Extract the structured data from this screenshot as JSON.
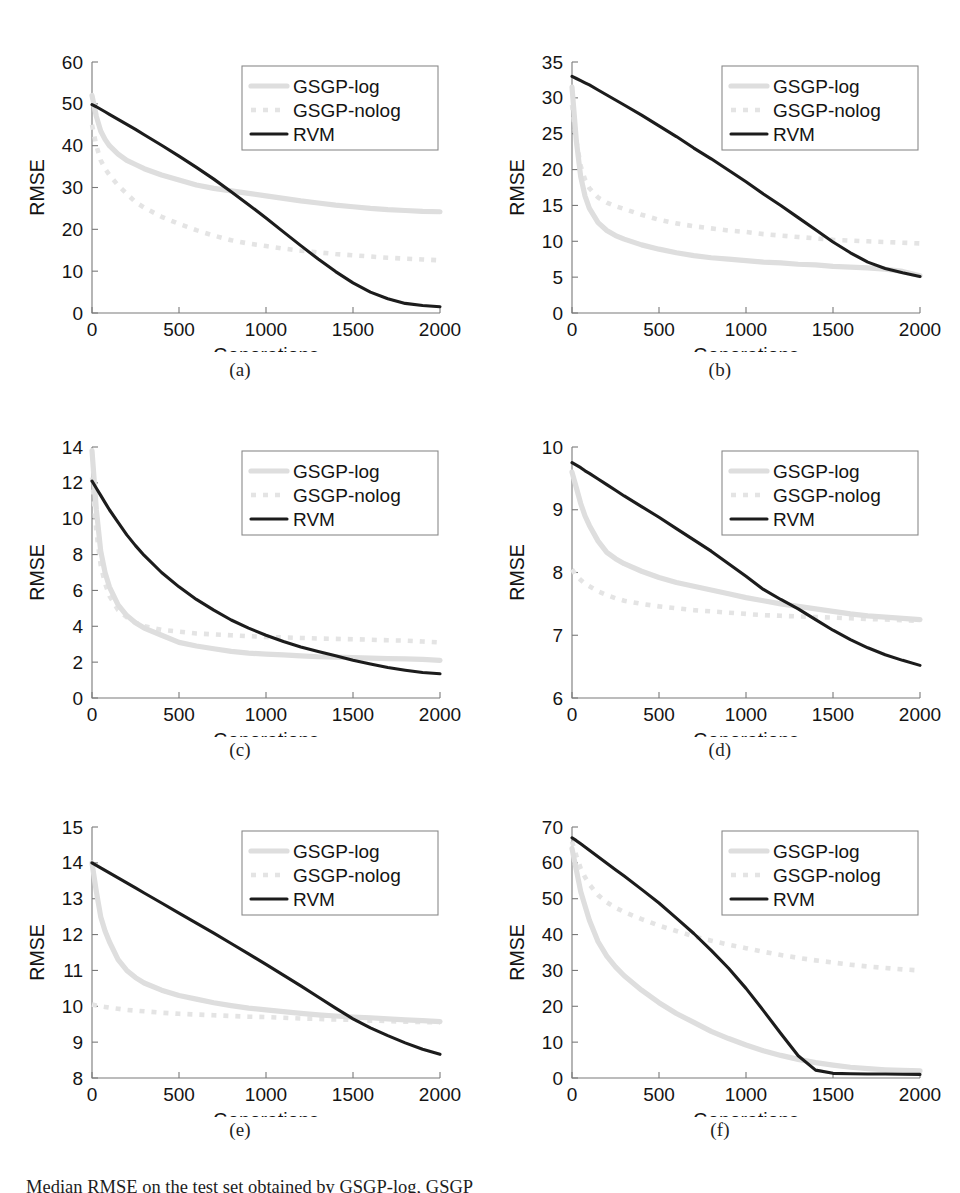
{
  "figure": {
    "caption": "Median RMSE on the test set obtained by GSGP-log, GSGP",
    "axis_titles": {
      "x": "Generations",
      "y": "RMSE"
    },
    "legend": {
      "entries": [
        {
          "label": "GSGP-log",
          "style": "thick-light-solid",
          "color": "#dedede"
        },
        {
          "label": "GSGP-nolog",
          "style": "light-dashed",
          "color": "#e4e4e4"
        },
        {
          "label": "RVM",
          "style": "black-solid",
          "color": "#1c1c1c"
        }
      ]
    }
  },
  "chart_data": [
    {
      "id": "a",
      "panel_label": "(a)",
      "type": "line",
      "title": "",
      "xlabel": "Generations",
      "ylabel": "RMSE",
      "xlim": [
        0,
        2000
      ],
      "ylim": [
        0,
        60
      ],
      "xticks": [
        0,
        500,
        1000,
        1500,
        2000
      ],
      "yticks": [
        0,
        10,
        20,
        30,
        40,
        50,
        60
      ],
      "grid": false,
      "legend_position": "top-right",
      "x": [
        0,
        25,
        50,
        75,
        100,
        150,
        200,
        250,
        300,
        400,
        500,
        600,
        700,
        800,
        900,
        1000,
        1100,
        1200,
        1300,
        1400,
        1500,
        1600,
        1700,
        1800,
        1900,
        2000
      ],
      "series": [
        {
          "name": "GSGP-log",
          "values": [
            52,
            47,
            43.5,
            41.5,
            40,
            38,
            36.5,
            35.5,
            34.5,
            33,
            31.8,
            30.6,
            29.8,
            29.2,
            28.6,
            28.0,
            27.4,
            26.8,
            26.3,
            25.8,
            25.4,
            25.0,
            24.7,
            24.5,
            24.3,
            24.2
          ]
        },
        {
          "name": "GSGP-nolog",
          "values": [
            45,
            40,
            36.5,
            34.5,
            33,
            30.5,
            28.5,
            26.5,
            25.2,
            23,
            21.3,
            19.8,
            18.5,
            17.4,
            16.6,
            16.0,
            15.4,
            14.9,
            14.5,
            14.1,
            13.8,
            13.5,
            13.2,
            13.0,
            12.8,
            12.6
          ]
        },
        {
          "name": "RVM",
          "values": [
            49.8,
            49.3,
            48.7,
            48.1,
            47.5,
            46.3,
            45.1,
            43.9,
            42.6,
            40.1,
            37.5,
            34.8,
            32.0,
            29.0,
            25.9,
            22.7,
            19.4,
            16.1,
            12.9,
            9.9,
            7.2,
            5.0,
            3.4,
            2.3,
            1.8,
            1.5
          ]
        }
      ]
    },
    {
      "id": "b",
      "panel_label": "(b)",
      "type": "line",
      "title": "",
      "xlabel": "Generations",
      "ylabel": "RMSE",
      "xlim": [
        0,
        2000
      ],
      "ylim": [
        0,
        35
      ],
      "xticks": [
        0,
        500,
        1000,
        1500,
        2000
      ],
      "yticks": [
        0,
        5,
        10,
        15,
        20,
        25,
        30,
        35
      ],
      "grid": false,
      "legend_position": "top-right",
      "x": [
        0,
        25,
        50,
        75,
        100,
        150,
        200,
        250,
        300,
        400,
        500,
        600,
        700,
        800,
        900,
        1000,
        1100,
        1200,
        1300,
        1400,
        1500,
        1600,
        1700,
        1800,
        1900,
        2000
      ],
      "series": [
        {
          "name": "GSGP-log",
          "values": [
            31.5,
            24,
            19,
            16.3,
            14.6,
            12.6,
            11.5,
            10.8,
            10.3,
            9.5,
            8.9,
            8.4,
            8.0,
            7.7,
            7.5,
            7.3,
            7.1,
            7.0,
            6.8,
            6.7,
            6.5,
            6.4,
            6.3,
            6.1,
            5.8,
            5.2
          ]
        },
        {
          "name": "GSGP-nolog",
          "values": [
            29,
            24,
            20.5,
            18.6,
            17.4,
            16.1,
            15.4,
            14.9,
            14.5,
            13.7,
            13.0,
            12.5,
            12.1,
            11.8,
            11.5,
            11.3,
            11.0,
            10.8,
            10.6,
            10.4,
            10.2,
            10.1,
            10.0,
            9.9,
            9.8,
            9.7
          ]
        },
        {
          "name": "RVM",
          "values": [
            33,
            32.7,
            32.4,
            32.1,
            31.8,
            31.1,
            30.4,
            29.7,
            29.0,
            27.6,
            26.1,
            24.6,
            23.0,
            21.5,
            19.9,
            18.3,
            16.6,
            15.0,
            13.3,
            11.6,
            9.9,
            8.4,
            7.1,
            6.2,
            5.6,
            5.1
          ]
        }
      ]
    },
    {
      "id": "c",
      "panel_label": "(c)",
      "type": "line",
      "title": "",
      "xlabel": "Generations",
      "ylabel": "RMSE",
      "xlim": [
        0,
        2000
      ],
      "ylim": [
        0,
        14
      ],
      "xticks": [
        0,
        500,
        1000,
        1500,
        2000
      ],
      "yticks": [
        0,
        2,
        4,
        6,
        8,
        10,
        12,
        14
      ],
      "grid": false,
      "legend_position": "top-right",
      "x": [
        0,
        25,
        50,
        75,
        100,
        150,
        200,
        250,
        300,
        400,
        500,
        600,
        700,
        800,
        900,
        1000,
        1100,
        1200,
        1300,
        1400,
        1500,
        1600,
        1700,
        1800,
        1900,
        2000
      ],
      "series": [
        {
          "name": "GSGP-log",
          "values": [
            13.8,
            10.5,
            8.2,
            7.0,
            6.2,
            5.2,
            4.6,
            4.2,
            3.9,
            3.5,
            3.1,
            2.9,
            2.75,
            2.6,
            2.5,
            2.45,
            2.4,
            2.35,
            2.3,
            2.28,
            2.25,
            2.22,
            2.2,
            2.18,
            2.15,
            2.1
          ]
        },
        {
          "name": "GSGP-nolog",
          "values": [
            12.3,
            9.3,
            7.4,
            6.4,
            5.7,
            4.9,
            4.5,
            4.2,
            4.0,
            3.8,
            3.7,
            3.6,
            3.55,
            3.5,
            3.45,
            3.4,
            3.38,
            3.35,
            3.32,
            3.3,
            3.28,
            3.25,
            3.22,
            3.2,
            3.15,
            3.1
          ]
        },
        {
          "name": "RVM",
          "values": [
            12.1,
            11.7,
            11.3,
            10.9,
            10.5,
            9.8,
            9.1,
            8.5,
            7.95,
            7.0,
            6.2,
            5.5,
            4.9,
            4.35,
            3.9,
            3.5,
            3.15,
            2.85,
            2.6,
            2.35,
            2.1,
            1.9,
            1.7,
            1.55,
            1.42,
            1.35
          ]
        }
      ]
    },
    {
      "id": "d",
      "panel_label": "(d)",
      "type": "line",
      "title": "",
      "xlabel": "Generations",
      "ylabel": "RMSE",
      "xlim": [
        0,
        2000
      ],
      "ylim": [
        6,
        10
      ],
      "xticks": [
        0,
        500,
        1000,
        1500,
        2000
      ],
      "yticks": [
        6,
        7,
        8,
        9,
        10
      ],
      "grid": false,
      "legend_position": "top-right",
      "x": [
        0,
        25,
        50,
        75,
        100,
        150,
        200,
        250,
        300,
        400,
        500,
        600,
        700,
        800,
        900,
        1000,
        1100,
        1200,
        1300,
        1400,
        1500,
        1600,
        1700,
        1800,
        1900,
        2000
      ],
      "series": [
        {
          "name": "GSGP-log",
          "values": [
            9.6,
            9.35,
            9.1,
            8.9,
            8.75,
            8.5,
            8.32,
            8.22,
            8.14,
            8.02,
            7.92,
            7.84,
            7.78,
            7.72,
            7.66,
            7.6,
            7.55,
            7.5,
            7.46,
            7.42,
            7.38,
            7.34,
            7.31,
            7.29,
            7.27,
            7.25
          ]
        },
        {
          "name": "GSGP-nolog",
          "values": [
            8.05,
            7.95,
            7.88,
            7.82,
            7.78,
            7.7,
            7.64,
            7.59,
            7.55,
            7.5,
            7.46,
            7.43,
            7.4,
            7.38,
            7.36,
            7.34,
            7.32,
            7.31,
            7.3,
            7.29,
            7.28,
            7.27,
            7.26,
            7.25,
            7.24,
            7.23
          ]
        },
        {
          "name": "RVM",
          "values": [
            9.75,
            9.71,
            9.67,
            9.62,
            9.58,
            9.49,
            9.4,
            9.31,
            9.22,
            9.05,
            8.88,
            8.7,
            8.52,
            8.34,
            8.14,
            7.94,
            7.73,
            7.57,
            7.42,
            7.25,
            7.08,
            6.93,
            6.8,
            6.69,
            6.6,
            6.52
          ]
        }
      ]
    },
    {
      "id": "e",
      "panel_label": "(e)",
      "type": "line",
      "title": "",
      "xlabel": "Generations",
      "ylabel": "RMSE",
      "xlim": [
        0,
        2000
      ],
      "ylim": [
        8,
        15
      ],
      "xticks": [
        0,
        500,
        1000,
        1500,
        2000
      ],
      "yticks": [
        8,
        9,
        10,
        11,
        12,
        13,
        14,
        15
      ],
      "grid": false,
      "legend_position": "top-right",
      "x": [
        0,
        25,
        50,
        75,
        100,
        150,
        200,
        250,
        300,
        400,
        500,
        600,
        700,
        800,
        900,
        1000,
        1100,
        1200,
        1300,
        1400,
        1500,
        1600,
        1700,
        1800,
        1900,
        2000
      ],
      "series": [
        {
          "name": "GSGP-log",
          "values": [
            14.0,
            13.2,
            12.5,
            12.1,
            11.8,
            11.3,
            11.0,
            10.8,
            10.65,
            10.45,
            10.3,
            10.2,
            10.1,
            10.02,
            9.95,
            9.9,
            9.85,
            9.8,
            9.76,
            9.73,
            9.7,
            9.68,
            9.65,
            9.62,
            9.6,
            9.57
          ]
        },
        {
          "name": "GSGP-nolog",
          "values": [
            10.05,
            10.02,
            10.0,
            9.98,
            9.96,
            9.93,
            9.9,
            9.88,
            9.86,
            9.82,
            9.79,
            9.77,
            9.75,
            9.73,
            9.71,
            9.7,
            9.68,
            9.66,
            9.65,
            9.63,
            9.62,
            9.6,
            9.59,
            9.57,
            9.56,
            9.55
          ]
        },
        {
          "name": "RVM",
          "values": [
            14.0,
            13.93,
            13.86,
            13.79,
            13.72,
            13.58,
            13.44,
            13.3,
            13.16,
            12.88,
            12.6,
            12.32,
            12.04,
            11.75,
            11.46,
            11.17,
            10.87,
            10.57,
            10.26,
            9.95,
            9.65,
            9.4,
            9.18,
            8.98,
            8.8,
            8.66
          ]
        }
      ]
    },
    {
      "id": "f",
      "panel_label": "(f)",
      "type": "line",
      "title": "",
      "xlabel": "Generations",
      "ylabel": "RMSE",
      "xlim": [
        0,
        2000
      ],
      "ylim": [
        0,
        70
      ],
      "xticks": [
        0,
        500,
        1000,
        1500,
        2000
      ],
      "yticks": [
        0,
        10,
        20,
        30,
        40,
        50,
        60,
        70
      ],
      "grid": false,
      "legend_position": "top-right",
      "x": [
        0,
        25,
        50,
        75,
        100,
        150,
        200,
        250,
        300,
        400,
        500,
        600,
        700,
        800,
        900,
        1000,
        1100,
        1200,
        1300,
        1400,
        1500,
        1600,
        1700,
        1800,
        1900,
        2000
      ],
      "series": [
        {
          "name": "GSGP-log",
          "values": [
            64,
            58,
            52,
            48,
            44,
            38,
            34,
            31,
            28.5,
            24.5,
            21,
            18,
            15.5,
            13,
            11,
            9.2,
            7.6,
            6.3,
            5.2,
            4.3,
            3.6,
            3.0,
            2.6,
            2.3,
            2.1,
            2.0
          ]
        },
        {
          "name": "GSGP-nolog",
          "values": [
            66,
            62,
            58.5,
            56,
            54,
            51,
            49,
            47.5,
            46.3,
            44.3,
            42.5,
            41,
            39.5,
            38.3,
            37.2,
            36.2,
            35.2,
            34.3,
            33.5,
            32.8,
            32.2,
            31.6,
            31.1,
            30.7,
            30.3,
            30.0
          ]
        },
        {
          "name": "RVM",
          "values": [
            67,
            66.2,
            65.3,
            64.4,
            63.5,
            61.7,
            59.9,
            58.1,
            56.3,
            52.6,
            48.8,
            44.6,
            40.3,
            35.6,
            30.6,
            25.0,
            18.8,
            12.4,
            6.2,
            2.2,
            1.3,
            1.2,
            1.1,
            1.1,
            1.05,
            1.0
          ]
        }
      ]
    }
  ]
}
